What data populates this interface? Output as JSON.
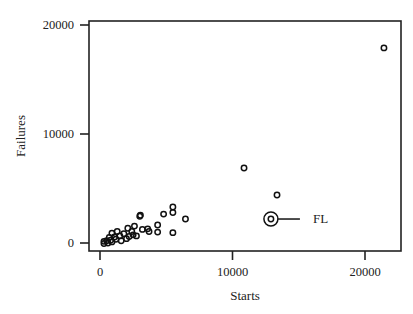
{
  "chart_data": {
    "type": "scatter",
    "title": "",
    "xlabel": "Starts",
    "ylabel": "Failures",
    "xlim": [
      -800,
      22800
    ],
    "ylim": [
      -750,
      20300
    ],
    "xticks": [
      0,
      10000,
      20000
    ],
    "xtick_labels": [
      "0",
      "10000",
      "20000"
    ],
    "yticks": [
      0,
      10000,
      20000
    ],
    "ytick_labels": [
      "0",
      "10000",
      "20000"
    ],
    "grid": false,
    "legend": null,
    "marker": "open-circle",
    "points": [
      {
        "x": 21430,
        "y": 17900
      },
      {
        "x": 10870,
        "y": 6880
      },
      {
        "x": 13360,
        "y": 4400
      },
      {
        "x": 12900,
        "y": 2200,
        "label": "FL",
        "highlight": true
      },
      {
        "x": 5500,
        "y": 3300
      },
      {
        "x": 5500,
        "y": 2800
      },
      {
        "x": 4800,
        "y": 2650
      },
      {
        "x": 6450,
        "y": 2200
      },
      {
        "x": 4350,
        "y": 1650
      },
      {
        "x": 4350,
        "y": 1000
      },
      {
        "x": 5500,
        "y": 950
      },
      {
        "x": 3050,
        "y": 2550
      },
      {
        "x": 3000,
        "y": 2450
      },
      {
        "x": 2600,
        "y": 1550
      },
      {
        "x": 3200,
        "y": 1250
      },
      {
        "x": 3600,
        "y": 1300
      },
      {
        "x": 3700,
        "y": 1050
      },
      {
        "x": 2100,
        "y": 1350
      },
      {
        "x": 1300,
        "y": 1050
      },
      {
        "x": 900,
        "y": 900
      },
      {
        "x": 2400,
        "y": 1050
      },
      {
        "x": 1800,
        "y": 850
      },
      {
        "x": 2750,
        "y": 650
      },
      {
        "x": 1500,
        "y": 650
      },
      {
        "x": 2200,
        "y": 600
      },
      {
        "x": 1100,
        "y": 550
      },
      {
        "x": 2000,
        "y": 400
      },
      {
        "x": 1200,
        "y": 350
      },
      {
        "x": 700,
        "y": 500
      },
      {
        "x": 800,
        "y": 250
      },
      {
        "x": 500,
        "y": 200
      },
      {
        "x": 300,
        "y": 150
      },
      {
        "x": 600,
        "y": 0
      },
      {
        "x": 300,
        "y": -50
      },
      {
        "x": 1600,
        "y": 200
      },
      {
        "x": 2500,
        "y": 750
      },
      {
        "x": 900,
        "y": 100
      }
    ],
    "annotations": [
      {
        "text": "FL",
        "x": 12900,
        "y": 2200,
        "style": "circled point with leader line"
      }
    ]
  }
}
